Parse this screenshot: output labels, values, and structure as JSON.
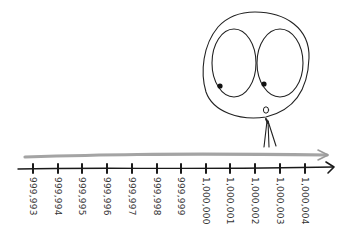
{
  "figure": {
    "colors": {
      "axis": "#1a1a1a",
      "progress_arrow": "#9a9a9a",
      "ink": "#222222"
    }
  },
  "number_line": {
    "ticks": [
      {
        "label": "999,993",
        "x": 33
      },
      {
        "label": "999,994",
        "x": 58
      },
      {
        "label": "999,995",
        "x": 82
      },
      {
        "label": "999,996",
        "x": 107
      },
      {
        "label": "999,997",
        "x": 132
      },
      {
        "label": "999,998",
        "x": 157
      },
      {
        "label": "999,999",
        "x": 181
      },
      {
        "label": "1,000,000",
        "x": 206
      },
      {
        "label": "1,000,001",
        "x": 230
      },
      {
        "label": "1,000,002",
        "x": 255
      },
      {
        "label": "1,000,003",
        "x": 280
      },
      {
        "label": "1,000,004",
        "x": 305
      }
    ],
    "label_orientation": "rotated 90° clockwise"
  },
  "character": {
    "head": "round outline",
    "eyes": "two large oval eyes with pupils looking down-left",
    "mouth": "small o"
  }
}
